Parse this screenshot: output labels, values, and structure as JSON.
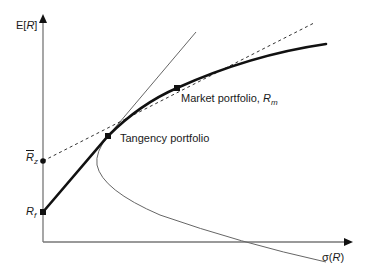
{
  "diagram": {
    "type": "efficient-frontier",
    "axes": {
      "y_label": {
        "prefix": "E[",
        "var": "R",
        "suffix": "]"
      },
      "x_label": {
        "prefix": "σ(",
        "var": "R",
        "suffix": ")"
      }
    },
    "points": {
      "risk_free": {
        "symbol": "R",
        "sub": "f"
      },
      "zero_beta": {
        "symbol": "R",
        "sub": "z"
      },
      "tangency": {
        "label": "Tangency portfolio"
      },
      "market": {
        "label": "Market portfolio, ",
        "symbol": "R",
        "sub": "m"
      }
    },
    "curves": [
      "Efficient frontier with risk-free asset (thick solid)",
      "Tangent line from risk-free rate (thin solid)",
      "Line from zero-beta return through market portfolio (dashed)",
      "Minimum-variance frontier hyperbola (thin solid)"
    ],
    "colors": {
      "thick_line": "#111111",
      "thin_line": "#666666",
      "axis": "#777777",
      "dashed": "#333333"
    }
  }
}
